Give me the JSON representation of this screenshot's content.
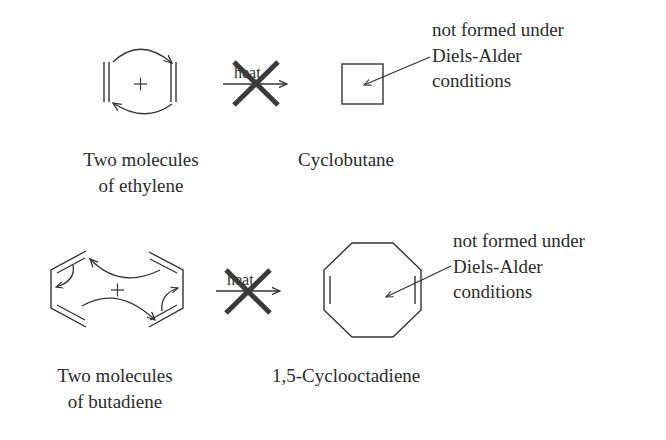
{
  "colors": {
    "ink": "#333333",
    "cross": "#3a3a3a",
    "background": "#ffffff"
  },
  "reactions": [
    {
      "id": "ethylene-dimerization",
      "reactant_label": [
        "Two molecules",
        "of ethylene"
      ],
      "reactant_symbol": "+",
      "arrow_label": "heat",
      "arrow_status": "crossed-out",
      "product_label": "Cyclobutane",
      "annotation": [
        "not formed under",
        "Diels-Alder",
        "conditions"
      ]
    },
    {
      "id": "butadiene-dimerization",
      "reactant_label": [
        "Two molecules",
        "of butadiene"
      ],
      "reactant_symbol": "+",
      "arrow_label": "heat",
      "arrow_status": "crossed-out",
      "product_label": "1,5-Cyclooctadiene",
      "annotation": [
        "not formed under",
        "Diels-Alder",
        "conditions"
      ]
    }
  ]
}
